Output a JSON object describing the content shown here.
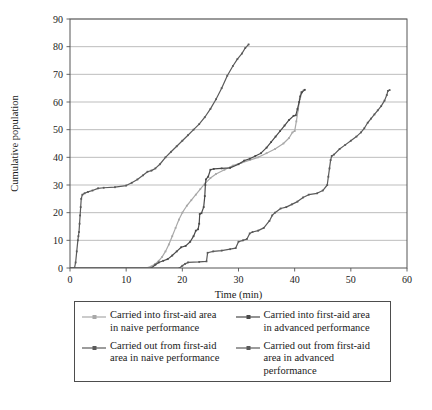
{
  "chart_data": {
    "type": "line",
    "title": "",
    "xlabel": "Time (min)",
    "ylabel": "Cumulative population",
    "xlim": [
      0,
      60
    ],
    "ylim": [
      0,
      90
    ],
    "xticks": [
      0,
      10,
      20,
      30,
      40,
      50,
      60
    ],
    "yticks": [
      0,
      10,
      20,
      30,
      40,
      50,
      60,
      70,
      80,
      90
    ],
    "grid": "horizontal",
    "legend_position": "below-plot",
    "series": [
      {
        "name": "Carried into first-aid area\nin naive performance",
        "key": "into_naive",
        "color": "#a8a8a8",
        "marker": "dot",
        "points": [
          [
            0,
            0
          ],
          [
            13.5,
            0
          ],
          [
            14.5,
            0.6
          ],
          [
            15.2,
            1.5
          ],
          [
            15.8,
            2.6
          ],
          [
            16.4,
            4.0
          ],
          [
            17.0,
            6.0
          ],
          [
            17.6,
            8.5
          ],
          [
            18.2,
            11.5
          ],
          [
            18.8,
            14.5
          ],
          [
            19.4,
            17.5
          ],
          [
            20.0,
            20.0
          ],
          [
            20.8,
            22.5
          ],
          [
            21.6,
            24.5
          ],
          [
            22.4,
            26.5
          ],
          [
            23.2,
            28.5
          ],
          [
            24.0,
            30.5
          ],
          [
            25.0,
            32.5
          ],
          [
            26.0,
            34.0
          ],
          [
            27.5,
            35.5
          ],
          [
            29.0,
            37.0
          ],
          [
            30.5,
            38.0
          ],
          [
            32.0,
            39.0
          ],
          [
            33.5,
            40.0
          ],
          [
            35.0,
            41.5
          ],
          [
            36.5,
            43.0
          ],
          [
            38.0,
            45.0
          ],
          [
            39.0,
            47.0
          ],
          [
            39.6,
            49.0
          ],
          [
            40.0,
            49.5
          ],
          [
            40.3,
            53.0
          ],
          [
            40.6,
            57.0
          ],
          [
            40.9,
            61.0
          ],
          [
            41.1,
            63.5
          ],
          [
            41.6,
            64.3
          ]
        ]
      },
      {
        "name": "Carried into first-aid area\nin advanced performance",
        "key": "into_advanced",
        "color": "#4a4a4a",
        "marker": "dot",
        "points": [
          [
            0,
            0
          ],
          [
            14.5,
            0
          ],
          [
            15.2,
            1.2
          ],
          [
            15.8,
            2.0
          ],
          [
            16.6,
            2.6
          ],
          [
            17.4,
            3.2
          ],
          [
            18.2,
            4.5
          ],
          [
            19.0,
            6.0
          ],
          [
            19.8,
            7.5
          ],
          [
            20.6,
            8.0
          ],
          [
            21.4,
            9.5
          ],
          [
            22.0,
            11.5
          ],
          [
            22.4,
            13.5
          ],
          [
            22.8,
            14.0
          ],
          [
            23.0,
            16.0
          ],
          [
            23.1,
            19.5
          ],
          [
            23.4,
            19.8
          ],
          [
            23.8,
            22.0
          ],
          [
            24.0,
            26.0
          ],
          [
            24.1,
            30.0
          ],
          [
            24.2,
            32.0
          ],
          [
            24.6,
            33.0
          ],
          [
            25.0,
            35.5
          ],
          [
            25.6,
            35.8
          ],
          [
            27.0,
            36.0
          ],
          [
            28.5,
            36.2
          ],
          [
            30.0,
            37.5
          ],
          [
            31.0,
            38.8
          ],
          [
            32.0,
            39.5
          ],
          [
            33.0,
            40.5
          ],
          [
            34.0,
            41.5
          ],
          [
            35.0,
            43.5
          ],
          [
            35.8,
            45.5
          ],
          [
            36.6,
            47.5
          ],
          [
            37.4,
            49.5
          ],
          [
            38.2,
            51.5
          ],
          [
            39.0,
            53.5
          ],
          [
            39.8,
            55.0
          ],
          [
            40.2,
            55.2
          ],
          [
            40.5,
            57.5
          ],
          [
            40.8,
            60.0
          ],
          [
            41.0,
            62.0
          ],
          [
            41.3,
            63.5
          ],
          [
            41.8,
            64.4
          ]
        ]
      },
      {
        "name": "Carried out from first-aid\narea in naive performance",
        "key": "out_naive",
        "color": "#5a5a5a",
        "marker": "dot",
        "points": [
          [
            0,
            0
          ],
          [
            0.8,
            0
          ],
          [
            1.0,
            2.0
          ],
          [
            1.2,
            6.0
          ],
          [
            1.4,
            10.0
          ],
          [
            1.5,
            11.5
          ],
          [
            1.6,
            13.0
          ],
          [
            1.7,
            16.0
          ],
          [
            1.8,
            19.0
          ],
          [
            1.9,
            22.0
          ],
          [
            2.0,
            25.0
          ],
          [
            2.2,
            26.5
          ],
          [
            2.6,
            27.0
          ],
          [
            3.2,
            27.5
          ],
          [
            4.0,
            28.0
          ],
          [
            5.0,
            28.8
          ],
          [
            6.0,
            29.0
          ],
          [
            8.0,
            29.2
          ],
          [
            10.0,
            29.8
          ],
          [
            11.0,
            30.8
          ],
          [
            12.0,
            32.0
          ],
          [
            13.0,
            33.5
          ],
          [
            13.8,
            34.8
          ],
          [
            14.5,
            35.2
          ],
          [
            15.2,
            36.0
          ],
          [
            16.0,
            37.5
          ],
          [
            17.0,
            40.0
          ],
          [
            18.0,
            42.0
          ],
          [
            19.0,
            44.0
          ],
          [
            20.0,
            46.0
          ],
          [
            21.0,
            48.0
          ],
          [
            22.0,
            50.0
          ],
          [
            23.0,
            52.0
          ],
          [
            24.0,
            54.5
          ],
          [
            25.0,
            57.5
          ],
          [
            26.0,
            61.0
          ],
          [
            27.0,
            65.0
          ],
          [
            28.0,
            69.5
          ],
          [
            29.0,
            73.0
          ],
          [
            29.8,
            75.5
          ],
          [
            30.6,
            77.5
          ],
          [
            31.2,
            79.5
          ],
          [
            31.8,
            80.8
          ]
        ]
      },
      {
        "name": "Carried out from first-aid\narea in advanced\nperformance",
        "key": "out_advanced",
        "color": "#5a5a5a",
        "marker": "dot",
        "points": [
          [
            0,
            0
          ],
          [
            19.5,
            0
          ],
          [
            20.0,
            0.8
          ],
          [
            20.5,
            1.5
          ],
          [
            21.0,
            2.0
          ],
          [
            23.0,
            2.2
          ],
          [
            24.3,
            2.4
          ],
          [
            24.5,
            5.5
          ],
          [
            25.5,
            6.0
          ],
          [
            27.0,
            6.3
          ],
          [
            28.5,
            6.8
          ],
          [
            29.5,
            7.2
          ],
          [
            30.0,
            9.5
          ],
          [
            30.8,
            10.0
          ],
          [
            31.5,
            10.5
          ],
          [
            32.0,
            12.5
          ],
          [
            32.5,
            13.0
          ],
          [
            33.5,
            13.5
          ],
          [
            34.5,
            14.5
          ],
          [
            35.5,
            17.0
          ],
          [
            36.0,
            19.0
          ],
          [
            36.5,
            20.0
          ],
          [
            37.5,
            21.5
          ],
          [
            38.5,
            22.0
          ],
          [
            39.5,
            23.0
          ],
          [
            40.5,
            24.0
          ],
          [
            41.5,
            25.5
          ],
          [
            42.5,
            26.5
          ],
          [
            44.0,
            27.0
          ],
          [
            45.0,
            28.0
          ],
          [
            45.8,
            30.0
          ],
          [
            46.0,
            33.0
          ],
          [
            46.2,
            36.0
          ],
          [
            46.4,
            39.0
          ],
          [
            46.6,
            40.5
          ],
          [
            47.0,
            41.0
          ],
          [
            48.0,
            43.0
          ],
          [
            49.0,
            44.5
          ],
          [
            50.0,
            46.0
          ],
          [
            51.0,
            47.5
          ],
          [
            51.8,
            49.0
          ],
          [
            52.4,
            50.5
          ],
          [
            53.0,
            52.5
          ],
          [
            53.6,
            54.0
          ],
          [
            54.2,
            55.5
          ],
          [
            54.8,
            57.0
          ],
          [
            55.4,
            58.5
          ],
          [
            56.0,
            60.5
          ],
          [
            56.4,
            62.5
          ],
          [
            56.6,
            64.0
          ],
          [
            56.9,
            64.3
          ]
        ]
      }
    ]
  },
  "legend": {
    "entries": [
      {
        "label": "Carried into first-aid area\nin naive performance",
        "color": "#a8a8a8",
        "name": "legend-item-into-naive"
      },
      {
        "label": "Carried into first-aid area\nin advanced performance",
        "color": "#4a4a4a",
        "name": "legend-item-into-advanced"
      },
      {
        "label": "Carried out from first-aid\narea in naive performance",
        "color": "#5a5a5a",
        "name": "legend-item-out-naive"
      },
      {
        "label": "Carried out from first-aid\narea in advanced\nperformance",
        "color": "#5a5a5a",
        "name": "legend-item-out-advanced"
      }
    ]
  },
  "axes": {
    "x_title": "Time (min)",
    "y_title": "Cumulative population",
    "x_tick_labels": [
      "0",
      "10",
      "20",
      "30",
      "40",
      "50",
      "60"
    ],
    "y_tick_labels": [
      "0",
      "10",
      "20",
      "30",
      "40",
      "50",
      "60",
      "70",
      "80",
      "90"
    ]
  },
  "colors": {
    "grid": "#a0a0a0",
    "axis": "#555555",
    "text": "#1a1a1a",
    "background": "#ffffff"
  }
}
